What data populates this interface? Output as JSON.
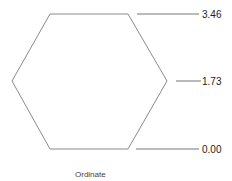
{
  "diagram": {
    "shape": "hexagon",
    "stroke_color": "#888888",
    "labels": [
      {
        "value": "3.46"
      },
      {
        "value": "1.73"
      },
      {
        "value": "0.00"
      }
    ],
    "axis_title": "Ordinate"
  }
}
